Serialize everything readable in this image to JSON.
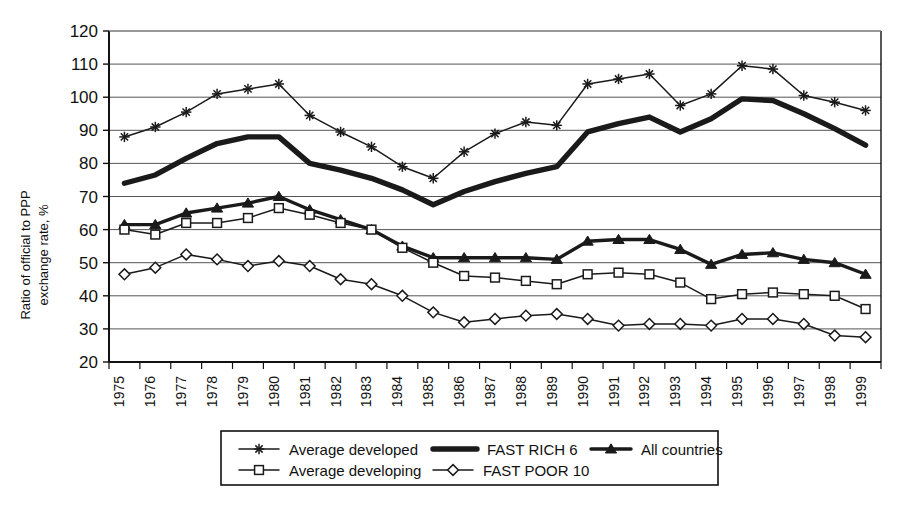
{
  "chart_data": {
    "type": "line",
    "title": "",
    "xlabel": "",
    "ylabel": "Ratio of official to PPP exchange rate, %",
    "ylim": [
      20,
      120
    ],
    "ytick_step": 10,
    "yticks": [
      20,
      30,
      40,
      50,
      60,
      70,
      80,
      90,
      100,
      110,
      120
    ],
    "grid": true,
    "legend_position": "bottom",
    "categories": [
      "1975",
      "1976",
      "1977",
      "1978",
      "1979",
      "1980",
      "1981",
      "1982",
      "1983",
      "1984",
      "1985",
      "1986",
      "1987",
      "1988",
      "1989",
      "1990",
      "1991",
      "1992",
      "1993",
      "1994",
      "1995",
      "1996",
      "1997",
      "1998",
      "1999"
    ],
    "series": [
      {
        "name": "Average developed",
        "marker": "asterisk",
        "line_weight": "thin",
        "color": "#1a1a1a",
        "values": [
          88,
          91,
          95.5,
          101,
          102.5,
          104,
          94.5,
          89.5,
          85,
          79,
          75.5,
          83.5,
          89,
          92.5,
          91.5,
          104,
          105.5,
          107,
          97.5,
          101,
          109.5,
          108.5,
          100.5,
          98.5,
          96
        ]
      },
      {
        "name": "FAST RICH 6",
        "marker": "none",
        "line_weight": "thick",
        "color": "#1a1a1a",
        "values": [
          74,
          76.5,
          81.5,
          86,
          88,
          88,
          80,
          78,
          75.5,
          72,
          67.5,
          71.5,
          74.5,
          77,
          79,
          89.5,
          92,
          94,
          89.5,
          93.5,
          99.5,
          99,
          95,
          90.5,
          85.5
        ]
      },
      {
        "name": "All countries",
        "marker": "triangle",
        "line_weight": "medium",
        "color": "#1a1a1a",
        "values": [
          61.5,
          61.5,
          65,
          66.5,
          68,
          70,
          66,
          63,
          60,
          55,
          51.5,
          51.5,
          51.5,
          51.5,
          51,
          56.5,
          57,
          57,
          54,
          49.5,
          52.5,
          53,
          51,
          50,
          46.5
        ]
      },
      {
        "name": "Average developing",
        "marker": "square",
        "line_weight": "thin",
        "color": "#1a1a1a",
        "values": [
          60,
          58.5,
          62,
          62,
          63.5,
          66.5,
          64.5,
          62,
          60,
          54.5,
          50,
          46,
          45.5,
          44.5,
          43.5,
          46.5,
          47,
          46.5,
          44,
          39,
          40.5,
          41,
          40.5,
          40,
          36
        ]
      },
      {
        "name": "FAST POOR 10",
        "marker": "diamond",
        "line_weight": "thin",
        "color": "#1a1a1a",
        "values": [
          46.5,
          48.5,
          52.5,
          51,
          49,
          50.5,
          49,
          45,
          43.5,
          40,
          35,
          32,
          33,
          34,
          34.5,
          33,
          31,
          31.5,
          31.5,
          31,
          33,
          33,
          31.5,
          28,
          27.5
        ]
      }
    ],
    "legend": [
      {
        "label": "Average developed",
        "marker": "asterisk",
        "line_weight": "thin"
      },
      {
        "label": "FAST RICH 6",
        "marker": "none",
        "line_weight": "thick"
      },
      {
        "label": "All countries",
        "marker": "triangle",
        "line_weight": "medium"
      },
      {
        "label": "Average developing",
        "marker": "square",
        "line_weight": "thin"
      },
      {
        "label": "FAST POOR 10",
        "marker": "diamond",
        "line_weight": "thin"
      }
    ]
  }
}
